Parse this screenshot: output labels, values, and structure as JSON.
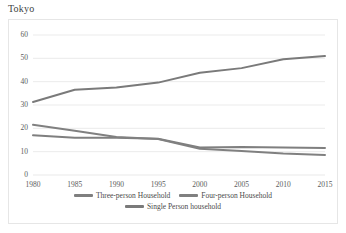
{
  "chart_title": "Tokyo",
  "chart_data": {
    "type": "line",
    "title": "Tokyo",
    "xlabel": "",
    "ylabel": "",
    "x": [
      1980,
      1985,
      1990,
      1995,
      2000,
      2005,
      2010,
      2015
    ],
    "categories": [
      "1980",
      "1985",
      "1990",
      "1995",
      "2000",
      "2005",
      "2010",
      "2015"
    ],
    "xtick_labels": [
      "1980",
      "1985",
      "1990",
      "1995",
      "2000",
      "2005",
      "2010",
      "2015"
    ],
    "ytick_labels": [
      "0",
      "10",
      "20",
      "30",
      "40",
      "50",
      "60"
    ],
    "yticks": [
      0,
      10,
      20,
      30,
      40,
      50,
      60
    ],
    "ylim": [
      0,
      60
    ],
    "xlim": [
      1980,
      2015
    ],
    "grid": "horizontal",
    "legend_position": "bottom",
    "series": [
      {
        "name": "Three-person Household",
        "color": "#7f7f7f",
        "values": [
          17.0,
          16.0,
          16.0,
          15.5,
          11.8,
          12.0,
          11.8,
          11.6
        ]
      },
      {
        "name": "Four-person Household",
        "color": "#808080",
        "values": [
          21.5,
          19.0,
          16.3,
          15.4,
          11.2,
          10.3,
          9.2,
          8.6
        ]
      },
      {
        "name": "Single Person household",
        "color": "#7a7a7a",
        "values": [
          31.3,
          36.5,
          37.5,
          39.6,
          43.8,
          45.8,
          49.6,
          51.0
        ]
      }
    ]
  },
  "legend": {
    "rows": [
      [
        {
          "label": "Three-person Household",
          "color": "#7f7f7f"
        },
        {
          "label": "Four-person Household",
          "color": "#808080"
        }
      ],
      [
        {
          "label": "Single Person household",
          "color": "#7a7a7a"
        }
      ]
    ]
  },
  "colors": {
    "grid": "#e9e9e9",
    "frame": "#e6e6e6",
    "tick_text": "#5c5c5c",
    "title_text": "#403f3f",
    "background": "#ffffff"
  }
}
